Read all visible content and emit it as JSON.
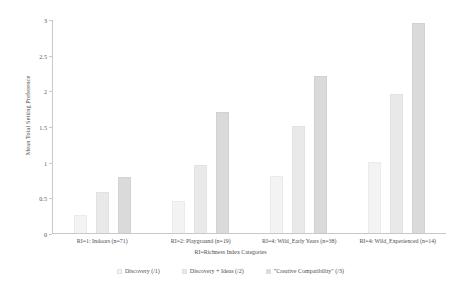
{
  "chart_data": {
    "type": "bar",
    "title": "",
    "xlabel": "RI=Richness Index Categories",
    "ylabel": "Mean Total Setting Preference",
    "ylim": [
      0,
      3
    ],
    "yticks": [
      "0",
      "0.5",
      "1",
      "1.5",
      "2",
      "2.5",
      "3"
    ],
    "ytick_values": [
      0,
      0.5,
      1,
      1.5,
      2,
      2.5,
      3
    ],
    "grid": false,
    "legend_position": "bottom",
    "categories": [
      "RI=1: Indoors (n=71)",
      "RI=2: Playground (n=19)",
      "RI=4: Wild_Early Years (n=38)",
      "RI=4: Wild_Experienced (n=14)"
    ],
    "series": [
      {
        "name": "Discovery (/1)",
        "color": "#f3f3f3",
        "values": [
          0.25,
          0.45,
          0.8,
          1.0
        ]
      },
      {
        "name": "Discovery + Ideas (/2)",
        "color": "#e9e9e9",
        "values": [
          0.58,
          0.95,
          1.5,
          1.95
        ]
      },
      {
        "name": "\"Creative Compatibility\" (/3)",
        "color": "#dadada",
        "values": [
          0.78,
          1.7,
          2.2,
          2.95
        ]
      }
    ]
  }
}
